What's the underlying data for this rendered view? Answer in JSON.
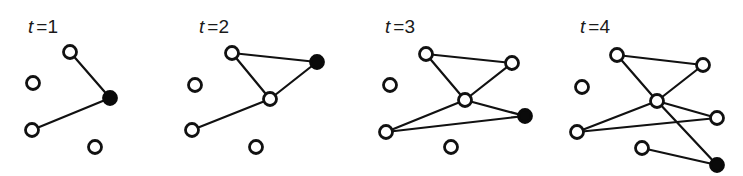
{
  "colors": {
    "edge": "#111111",
    "node_open_fill": "#ffffff",
    "node_stroke": "#111111",
    "node_new": "#0a0a0a"
  },
  "panels": [
    {
      "label_var": "t",
      "label_val": "=1",
      "label_pos": [
        28,
        33
      ],
      "nodes": [
        {
          "id": "a",
          "x": 70,
          "y": 52,
          "filled": false
        },
        {
          "id": "b",
          "x": 33,
          "y": 83,
          "filled": false
        },
        {
          "id": "new",
          "x": 110,
          "y": 98,
          "filled": true
        },
        {
          "id": "c",
          "x": 32,
          "y": 130,
          "filled": false
        },
        {
          "id": "d",
          "x": 95,
          "y": 147,
          "filled": false
        }
      ],
      "edges": [
        [
          "a",
          "new"
        ],
        [
          "c",
          "new"
        ]
      ]
    },
    {
      "label_var": "t",
      "label_val": "=2",
      "label_pos": [
        199,
        33
      ],
      "nodes": [
        {
          "id": "a",
          "x": 232,
          "y": 53,
          "filled": false
        },
        {
          "id": "b",
          "x": 195,
          "y": 85,
          "filled": false
        },
        {
          "id": "new",
          "x": 317,
          "y": 62,
          "filled": true
        },
        {
          "id": "m",
          "x": 270,
          "y": 99,
          "filled": false
        },
        {
          "id": "c",
          "x": 192,
          "y": 130,
          "filled": false
        },
        {
          "id": "d",
          "x": 256,
          "y": 147,
          "filled": false
        }
      ],
      "edges": [
        [
          "a",
          "new"
        ],
        [
          "a",
          "m"
        ],
        [
          "m",
          "new"
        ],
        [
          "c",
          "m"
        ]
      ]
    },
    {
      "label_var": "t",
      "label_val": "=3",
      "label_pos": [
        385,
        33
      ],
      "nodes": [
        {
          "id": "a",
          "x": 426,
          "y": 54,
          "filled": false
        },
        {
          "id": "b",
          "x": 390,
          "y": 85,
          "filled": false
        },
        {
          "id": "r",
          "x": 512,
          "y": 63,
          "filled": false
        },
        {
          "id": "m",
          "x": 465,
          "y": 100,
          "filled": false
        },
        {
          "id": "new",
          "x": 525,
          "y": 116,
          "filled": true
        },
        {
          "id": "c",
          "x": 386,
          "y": 132,
          "filled": false
        },
        {
          "id": "d",
          "x": 451,
          "y": 147,
          "filled": false
        }
      ],
      "edges": [
        [
          "a",
          "r"
        ],
        [
          "a",
          "m"
        ],
        [
          "m",
          "r"
        ],
        [
          "c",
          "m"
        ],
        [
          "m",
          "new"
        ],
        [
          "c",
          "new"
        ]
      ]
    },
    {
      "label_var": "t",
      "label_val": "=4",
      "label_pos": [
        580,
        33
      ],
      "nodes": [
        {
          "id": "a",
          "x": 617,
          "y": 55,
          "filled": false
        },
        {
          "id": "b",
          "x": 582,
          "y": 87,
          "filled": false
        },
        {
          "id": "r",
          "x": 703,
          "y": 65,
          "filled": false
        },
        {
          "id": "m",
          "x": 657,
          "y": 101,
          "filled": false
        },
        {
          "id": "r2",
          "x": 717,
          "y": 118,
          "filled": false
        },
        {
          "id": "c",
          "x": 577,
          "y": 132,
          "filled": false
        },
        {
          "id": "d",
          "x": 642,
          "y": 148,
          "filled": false
        },
        {
          "id": "new",
          "x": 717,
          "y": 165,
          "filled": true
        }
      ],
      "edges": [
        [
          "a",
          "r"
        ],
        [
          "a",
          "m"
        ],
        [
          "m",
          "r"
        ],
        [
          "c",
          "m"
        ],
        [
          "m",
          "r2"
        ],
        [
          "c",
          "r2"
        ],
        [
          "m",
          "new"
        ],
        [
          "d",
          "new"
        ]
      ]
    }
  ]
}
